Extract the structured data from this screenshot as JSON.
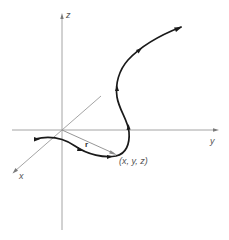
{
  "figure": {
    "axes": {
      "z_label": "z",
      "y_label": "y",
      "x_label": "x"
    },
    "vector_label": "r",
    "point_label": "(x, y, z)",
    "colors": {
      "axis": "#9a9a9a",
      "curve": "#1a1a1a",
      "vector": "#8a8a8a",
      "label": "#555555",
      "background": "#ffffff"
    }
  }
}
